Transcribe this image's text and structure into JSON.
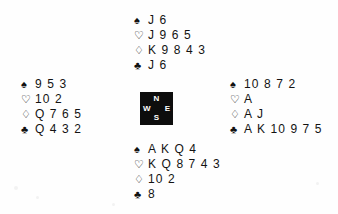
{
  "diagram": {
    "type": "bridge-hand-diagram",
    "suit_symbols": {
      "spades": "♠",
      "hearts": "♡",
      "diamonds": "♢",
      "clubs": "♣"
    },
    "compass": {
      "north": "N",
      "west": "W",
      "east": "E",
      "south": "S"
    },
    "hands": {
      "north": {
        "position": "North",
        "spades": "J 6",
        "hearts": "J 9 6 5",
        "diamonds": "K 9 8 4 3",
        "clubs": "J 6"
      },
      "west": {
        "position": "West",
        "spades": "9 5 3",
        "hearts": "10 2",
        "diamonds": "Q 7 6 5",
        "clubs": "Q 4 3 2"
      },
      "east": {
        "position": "East",
        "spades": "10 8 7 2",
        "hearts": "A",
        "diamonds": "A J",
        "clubs": "A K 10 9 7 5"
      },
      "south": {
        "position": "South",
        "spades": "A K Q 4",
        "hearts": "K Q 8 7 4 3",
        "diamonds": "10 2",
        "clubs": "8"
      }
    },
    "colors": {
      "ink": "#131313",
      "compass_background": "#0d0d0d",
      "compass_text": "#ffffff",
      "page_background": "#fefefe"
    }
  }
}
